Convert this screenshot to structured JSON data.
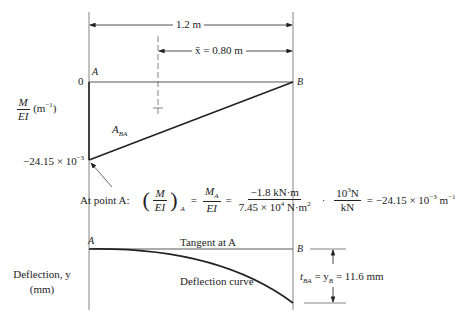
{
  "dimensions": {
    "span_label": "1.2 m",
    "xbar_label": "x̄ = 0.80 m"
  },
  "moment_diagram": {
    "y_axis_label_num": "M",
    "y_axis_label_den": "EI",
    "y_axis_unit": "(m",
    "y_axis_unit_exp": "−1",
    "y_axis_unit_close": ")",
    "zero_tick": "0",
    "min_value_label": "−24.15 × 10",
    "min_value_exp": "−3",
    "point_a": "A",
    "point_b": "B",
    "area_label": "A",
    "area_label_sub": "BA"
  },
  "equation": {
    "prefix": "At point A:",
    "lhs_num": "M",
    "lhs_den": "EI",
    "lhs_sub": "A",
    "mid_num": "M",
    "mid_num_sub": "A",
    "mid_den": "EI",
    "val_num": "−1.8 kN·m",
    "val_den": "7.45 × 10",
    "val_den_exp": "4",
    "val_den_unit": " N·m",
    "val_den_unit_exp": "2",
    "conv_num": "10",
    "conv_num_exp": "3",
    "conv_num_unit": "N",
    "conv_den": "kN",
    "result": "= −24.15 × 10",
    "result_exp": "−3",
    "result_unit": " m",
    "result_unit_exp": "−1",
    "eq": "=",
    "dot": "·"
  },
  "deflection_diagram": {
    "y_axis_label_line1": "Deflection, y",
    "y_axis_label_line2": "(mm)",
    "point_a": "A",
    "point_b": "B",
    "tangent_label": "Tangent at A",
    "curve_label": "Deflection curve",
    "tba_label": "t",
    "tba_sub": "BA",
    "yb_label": " = y",
    "yb_sub": "B",
    "tba_value": " = 11.6 mm"
  },
  "colors": {
    "line": "#222222",
    "guide": "#555555",
    "background": "#ffffff"
  }
}
